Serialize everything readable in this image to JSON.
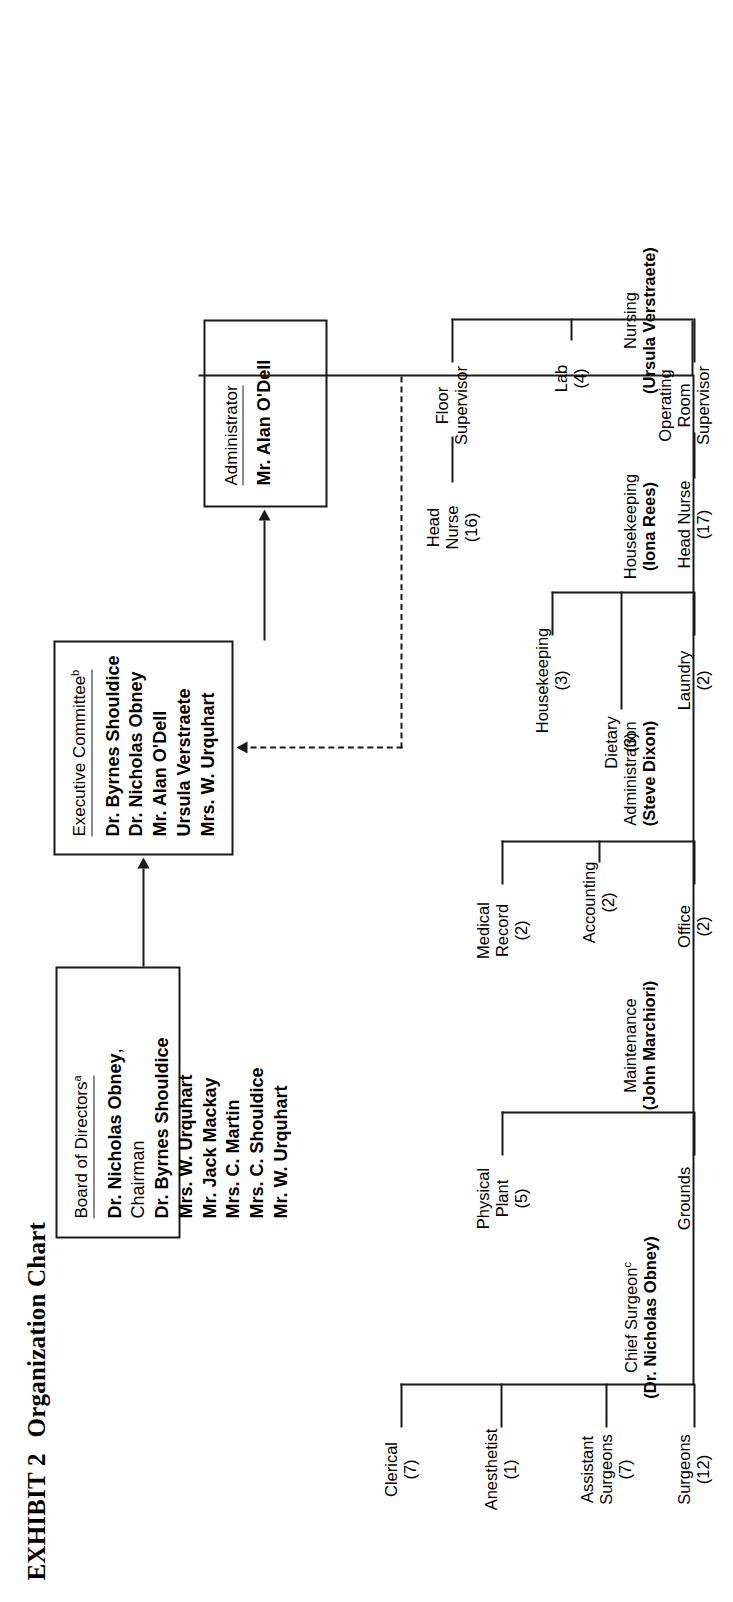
{
  "exhibit": {
    "label": "EXHIBIT 2",
    "title": "Organization Chart"
  },
  "boxes": {
    "board": {
      "heading": "Board of Directors",
      "heading_superscript": "a",
      "members": [
        {
          "bold": "Dr. Nicholas Obney",
          "rest": ", Chairman"
        },
        {
          "bold": "Dr. Byrnes Shouldice",
          "rest": ""
        },
        {
          "bold": "Mrs. W. Urquhart",
          "rest": ""
        },
        {
          "bold": "Mr. Jack Mackay",
          "rest": ""
        },
        {
          "bold": "Mrs. C. Martin",
          "rest": ""
        },
        {
          "bold": "Mrs. C. Shouldice",
          "rest": ""
        },
        {
          "bold": "Mr. W. Urquhart",
          "rest": ""
        }
      ]
    },
    "executive_committee": {
      "heading": "Executive Committee",
      "heading_superscript": "b",
      "members": [
        "Dr. Byrnes Shouldice",
        "Dr. Nicholas Obney",
        "Mr. Alan O'Dell",
        "Ursula Verstraete",
        "Mrs. W. Urquhart"
      ]
    },
    "administrator": {
      "heading": "Administrator",
      "name": "Mr. Alan O'Dell"
    }
  },
  "departments": [
    {
      "name": "Nursing",
      "manager": "(Ursula Verstraete)",
      "units": [
        {
          "lines": [
            "Floor",
            "Supervisor"
          ],
          "count": "",
          "sub": {
            "lines": [
              "Head",
              "Nurse"
            ],
            "count": "(16)"
          }
        },
        {
          "lines": [
            "Lab"
          ],
          "count": "(4)"
        },
        {
          "lines": [
            "Operating",
            "Room",
            "Supervisor"
          ],
          "count": "",
          "sub": {
            "lines": [
              "Head Nurse"
            ],
            "count": "(17)"
          }
        }
      ]
    },
    {
      "name": "Housekeeping",
      "manager": "(Iona Rees)",
      "units": [
        {
          "lines": [
            "Laundry"
          ],
          "count": "(2)"
        },
        {
          "lines": [
            "Housekeeping"
          ],
          "count": "(3)"
        }
      ],
      "extra_unit": {
        "lines": [
          "Dietary"
        ],
        "count": "(3)"
      }
    },
    {
      "name": "Administration",
      "manager": "(Steve Dixon)",
      "units": [
        {
          "lines": [
            "Office"
          ],
          "count": "(2)"
        },
        {
          "lines": [
            "Accounting"
          ],
          "count": "(2)"
        },
        {
          "lines": [
            "Medical",
            "Record"
          ],
          "count": "(2)"
        }
      ]
    },
    {
      "name": "Maintenance",
      "manager": "(John Marchiori)",
      "units": [
        {
          "lines": [
            "Grounds"
          ],
          "count": ""
        },
        {
          "lines": [
            "Physical",
            "Plant"
          ],
          "count": "(5)"
        }
      ]
    },
    {
      "name": "Chief Surgeon",
      "name_superscript": "c",
      "manager": "(Dr. Nicholas Obney)",
      "units": [
        {
          "lines": [
            "Surgeons"
          ],
          "count": "(12)"
        },
        {
          "lines": [
            "Assistant",
            "Surgeons"
          ],
          "count": "(7)"
        },
        {
          "lines": [
            "Anesthetist"
          ],
          "count": "(1)"
        },
        {
          "lines": [
            "Clerical"
          ],
          "count": "(7)"
        }
      ]
    }
  ],
  "colors": {
    "line": "#1a1a1a",
    "background": "#ffffff"
  }
}
